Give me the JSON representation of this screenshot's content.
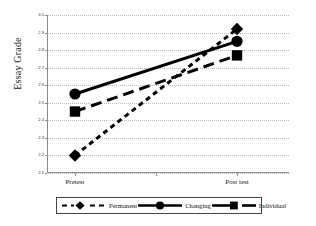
{
  "chart_data": {
    "type": "line",
    "title": "",
    "xlabel": "",
    "ylabel": "Essay Grade",
    "categories": [
      "Pretest",
      "Post test"
    ],
    "x": [
      0,
      1
    ],
    "ylim": [
      2.1,
      3.0
    ],
    "ytick_labels": [
      "3.0",
      "2.9",
      "2.8",
      "2.7",
      "2.6",
      "2.5",
      "2.4",
      "2.3",
      "2.2",
      "2.1"
    ],
    "ytick_values": [
      3.0,
      2.9,
      2.8,
      2.7,
      2.6,
      2.5,
      2.4,
      2.3,
      2.2,
      2.1
    ],
    "grid": true,
    "legend_position": "bottom",
    "series": [
      {
        "name": "Permanent",
        "values": [
          2.2,
          2.92
        ],
        "marker": "diamond",
        "linestyle": "dashed",
        "color": "#000000"
      },
      {
        "name": "Changing",
        "values": [
          2.55,
          2.85
        ],
        "marker": "circle",
        "linestyle": "solid",
        "color": "#000000"
      },
      {
        "name": "Individual",
        "values": [
          2.45,
          2.77
        ],
        "marker": "square",
        "linestyle": "long-dash",
        "color": "#000000"
      }
    ]
  },
  "axes": {
    "y_title": "Essay Grade",
    "x_labels": [
      "Pretest",
      "Post test"
    ]
  },
  "legend": {
    "items": [
      {
        "label": "Permanent",
        "marker": "diamond-marker-icon"
      },
      {
        "label": "Changing",
        "marker": "circle-marker-icon"
      },
      {
        "label": "Individual",
        "marker": "square-marker-icon"
      }
    ]
  },
  "colors": {
    "ink": "#000000",
    "axis": "#8a8a8a",
    "grid": "#b9b9c4",
    "background": "#ffffff"
  }
}
